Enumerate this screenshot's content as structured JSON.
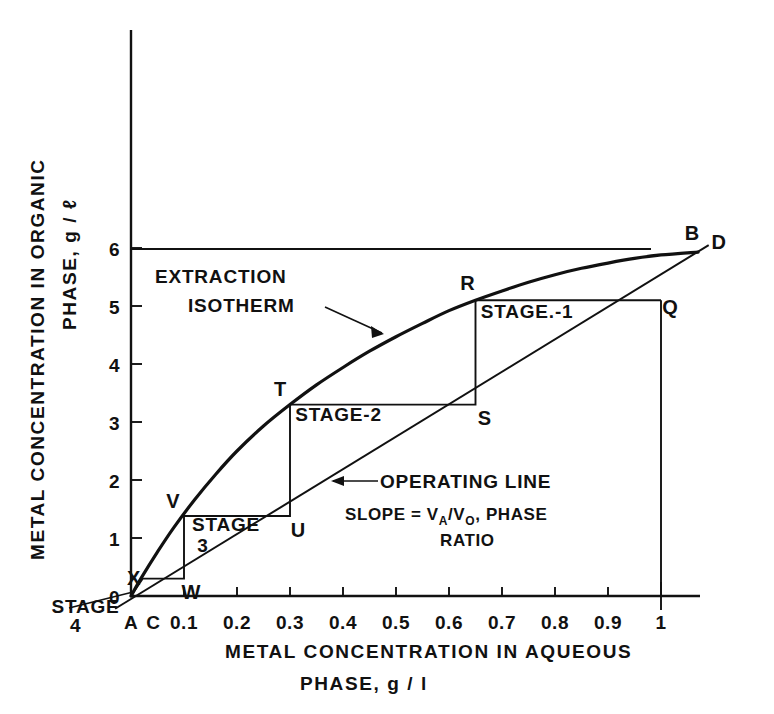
{
  "chart_data": {
    "type": "line",
    "title": "",
    "xlabel": "METAL CONCENTRATION IN AQUEOUS PHASE,  g / l",
    "xlabel_line1": "METAL  CONCENTRATION  IN  AQUEOUS",
    "xlabel_line2": "PHASE,   g / l",
    "ylabel": "METAL CONCENTRATION IN ORGANIC PHASE, g / ℓ",
    "ylabel_line1": "METAL  CONCENTRATION  IN  ORGANIC",
    "ylabel_line2": "PHASE,   g / ℓ",
    "xlim": [
      0,
      1.12
    ],
    "ylim": [
      0,
      6.6
    ],
    "grid": false,
    "legend": "none",
    "xticks": [
      "0.1",
      "0.2",
      "0.3",
      "0.4",
      "0.5",
      "0.6",
      "0.7",
      "0.8",
      "0.9",
      "1"
    ],
    "xtick_values": [
      0.1,
      0.2,
      0.3,
      0.4,
      0.5,
      0.6,
      0.7,
      0.8,
      0.9,
      1.0
    ],
    "yticks": [
      "0",
      "1",
      "2",
      "3",
      "4",
      "5",
      "6"
    ],
    "ytick_values": [
      0,
      1,
      2,
      3,
      4,
      5,
      6
    ],
    "series": [
      {
        "name": "EXTRACTION ISOTHERM",
        "type": "curve",
        "points": [
          [
            0.0,
            0.0
          ],
          [
            0.02,
            0.32
          ],
          [
            0.05,
            0.76
          ],
          [
            0.08,
            1.17
          ],
          [
            0.12,
            1.66
          ],
          [
            0.16,
            2.1
          ],
          [
            0.2,
            2.5
          ],
          [
            0.25,
            2.93
          ],
          [
            0.3,
            3.3
          ],
          [
            0.35,
            3.64
          ],
          [
            0.4,
            3.94
          ],
          [
            0.45,
            4.22
          ],
          [
            0.5,
            4.47
          ],
          [
            0.55,
            4.7
          ],
          [
            0.6,
            4.92
          ],
          [
            0.65,
            5.1
          ],
          [
            0.7,
            5.26
          ],
          [
            0.75,
            5.41
          ],
          [
            0.8,
            5.54
          ],
          [
            0.85,
            5.65
          ],
          [
            0.9,
            5.74
          ],
          [
            0.95,
            5.82
          ],
          [
            1.0,
            5.88
          ],
          [
            1.07,
            5.93
          ]
        ]
      },
      {
        "name": "OPERATING LINE",
        "type": "line",
        "points": [
          [
            -0.03,
            -0.22
          ],
          [
            1.09,
            6.05
          ]
        ],
        "annotation": "SLOPE = VA/VO, PHASE RATIO"
      }
    ],
    "staircase": {
      "name": "stage construction",
      "vertices": [
        {
          "label": "B",
          "x": 1.07,
          "y": 5.93,
          "on": "isotherm"
        },
        {
          "label": "D",
          "x": 1.09,
          "y": 6.05,
          "on": "operating-line-end"
        },
        {
          "label": "Q",
          "x": 1.0,
          "y": 5.1,
          "on": "operating-line"
        },
        {
          "label": "R",
          "x": 0.65,
          "y": 5.1,
          "on": "isotherm"
        },
        {
          "label": "S",
          "x": 0.65,
          "y": 3.3,
          "on": "operating-line"
        },
        {
          "label": "T",
          "x": 0.3,
          "y": 3.3,
          "on": "isotherm"
        },
        {
          "label": "U",
          "x": 0.3,
          "y": 1.38,
          "on": "operating-line"
        },
        {
          "label": "V",
          "x": 0.1,
          "y": 1.38,
          "on": "isotherm"
        },
        {
          "label": "W",
          "x": 0.1,
          "y": 0.3,
          "on": "operating-line"
        },
        {
          "label": "X",
          "x": 0.022,
          "y": 0.3,
          "on": "isotherm"
        },
        {
          "label": "A",
          "x": 0.0,
          "y": 0.0,
          "on": "origin"
        },
        {
          "label": "C",
          "x": 0.04,
          "y": 0.0,
          "on": "x-axis"
        }
      ]
    },
    "stage_labels": [
      {
        "text": "STAGE.-1",
        "x": 0.66,
        "y": 4.8
      },
      {
        "text": "STAGE-2",
        "x": 0.31,
        "y": 3.02
      },
      {
        "text": "STAGE",
        "x": 0.115,
        "y": 1.12
      },
      {
        "text": "3",
        "x": 0.125,
        "y": 0.76
      },
      {
        "text": "STAGE",
        "x": -0.15,
        "y": -0.3
      },
      {
        "text": "4",
        "x": -0.115,
        "y": -0.62
      }
    ],
    "annotations": [
      {
        "name": "isotherm-label-line1",
        "text": "EXTRACTION"
      },
      {
        "name": "isotherm-label-line2",
        "text": "ISOTHERM"
      },
      {
        "name": "operating-line-label",
        "text": "OPERATING  LINE"
      },
      {
        "name": "slope-label-prefix",
        "text": "SLOPE = V"
      },
      {
        "name": "slope-sub-a",
        "text": "A"
      },
      {
        "name": "slope-slash",
        "text": "/V"
      },
      {
        "name": "slope-sub-o",
        "text": "O"
      },
      {
        "name": "slope-suffix",
        "text": ", PHASE"
      },
      {
        "name": "slope-ratio",
        "text": "RATIO"
      }
    ]
  },
  "colors": {
    "background": "#ffffff",
    "ink": "#111111"
  }
}
